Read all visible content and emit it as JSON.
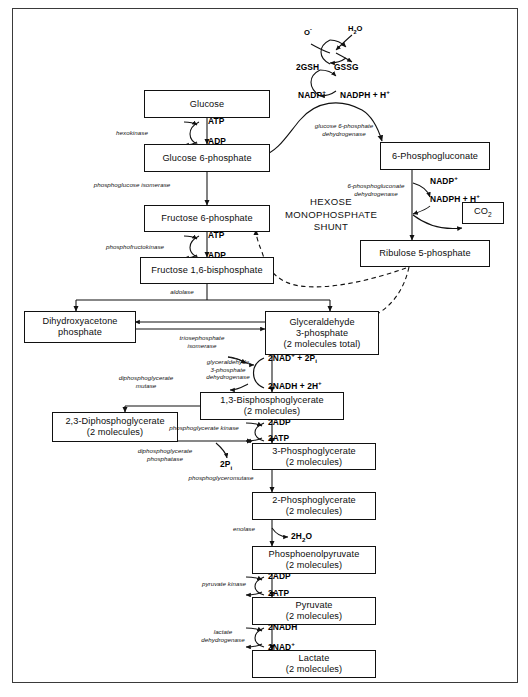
{
  "diagram": {
    "pathway_label": "HEXOSE\nMONOPHOSPHATE\nSHUNT",
    "colors": {
      "ink": "#111111",
      "frame": "#3a3a3a",
      "background": "#ffffff"
    }
  },
  "metabolites": {
    "glucose": {
      "line1": "Glucose",
      "line2": ""
    },
    "glucose6p": {
      "line1": "Glucose 6-phosphate",
      "line2": ""
    },
    "fructose6p": {
      "line1": "Fructose 6-phosphate",
      "line2": ""
    },
    "fructose16bp": {
      "line1": "Fructose 1,6-bisphosphate",
      "line2": ""
    },
    "dhap": {
      "line1": "Dihydroxyacetone",
      "line2": "phosphate"
    },
    "g3p": {
      "line1": "Glyceraldehyde",
      "line2": "3-phosphate",
      "line3": "(2 molecules total)"
    },
    "bpg13": {
      "line1": "1,3-Bisphosphoglycerate",
      "line2": "(2 molecules)"
    },
    "dpg23": {
      "line1": "2,3-Diphosphoglycerate",
      "line2": "(2 molecules)"
    },
    "pg3": {
      "line1": "3-Phosphoglycerate",
      "line2": "(2 molecules)"
    },
    "pg2": {
      "line1": "2-Phosphoglycerate",
      "line2": "(2 molecules)"
    },
    "pep": {
      "line1": "Phosphoenolpyruvate",
      "line2": "(2 molecules)"
    },
    "pyruvate": {
      "line1": "Pyruvate",
      "line2": "(2 molecules)"
    },
    "lactate": {
      "line1": "Lactate",
      "line2": "(2 molecules)"
    },
    "phosphogluconate6": {
      "line1": "6-Phosphogluconate",
      "line2": ""
    },
    "ribulose5p": {
      "line1": "Ribulose 5-phosphate",
      "line2": ""
    },
    "co2": {
      "line1": "CO",
      "sub": "2"
    }
  },
  "enzymes": {
    "hexokinase": "hexokinase",
    "phosphoglucose_isomerase": "phosphoglucose isomerase",
    "phosphofructokinase": "phosphofructokinase",
    "aldolase": "aldolase",
    "triosephosphate_isomerase": "triosephosphate\nisomerase",
    "g3p_dehydrogenase": "glyceraldehyde\n3-phosphate\ndehydrogenase",
    "diphosphoglycerate_mutase": "diphosphoglycerate\nmutase",
    "phosphoglycerate_kinase": "phosphoglycerate kinase",
    "diphosphoglycerate_phosphatase": "diphosphoglycerate\nphosphatase",
    "phosphoglyceromutase": "phosphoglyceromutase",
    "enolase": "enolase",
    "pyruvate_kinase": "pyruvate kinase",
    "lactate_dehydrogenase": "lactate\ndehydrogenase",
    "g6p_dehydrogenase": "glucose 6-phosphate\ndehydrogenase",
    "phosphogluconate_dehydrogenase": "6-phosphogluconate\ndehydrogenase"
  },
  "cofactors": {
    "atp_1": "ATP",
    "adp_1": "ADP",
    "atp_2": "ATP",
    "adp_2": "ADP",
    "nad_g3p": "2NAD",
    "nad_g3p_sup": "+",
    "nad_g3p_tail": " + 2P",
    "nad_g3p_sub": "i",
    "nadh_g3p": "2NADH + 2H",
    "nadh_g3p_sup": "+",
    "adp_pgk": "2ADP",
    "atp_pgk": "2ATP",
    "pi_dpg": "2P",
    "pi_dpg_sub": "i",
    "water_enolase": "2H",
    "water_enolase_sub": "2",
    "water_enolase_tail": "O",
    "adp_pk": "2ADP",
    "atp_pk": "2ATP",
    "nadh_ldh": "2NADH",
    "nad_ldh": "2NAD",
    "nad_ldh_sup": "+",
    "nadp_g6pd": "NADP",
    "nadp_g6pd_sup": "+",
    "nadph_g6pd": "NADPH + H",
    "nadph_g6pd_sup": "+",
    "nadp_pgd": "NADP",
    "nadp_pgd_sup": "+",
    "nadph_pgd": "NADPH + H",
    "nadph_pgd_sup": "+"
  },
  "redox_cycle": {
    "oxidant": "O",
    "oxidant_sup": "-",
    "water": "H",
    "water_sub": "2",
    "water_tail": "O",
    "gsh": "2GSH",
    "gssg": "GSSG"
  }
}
